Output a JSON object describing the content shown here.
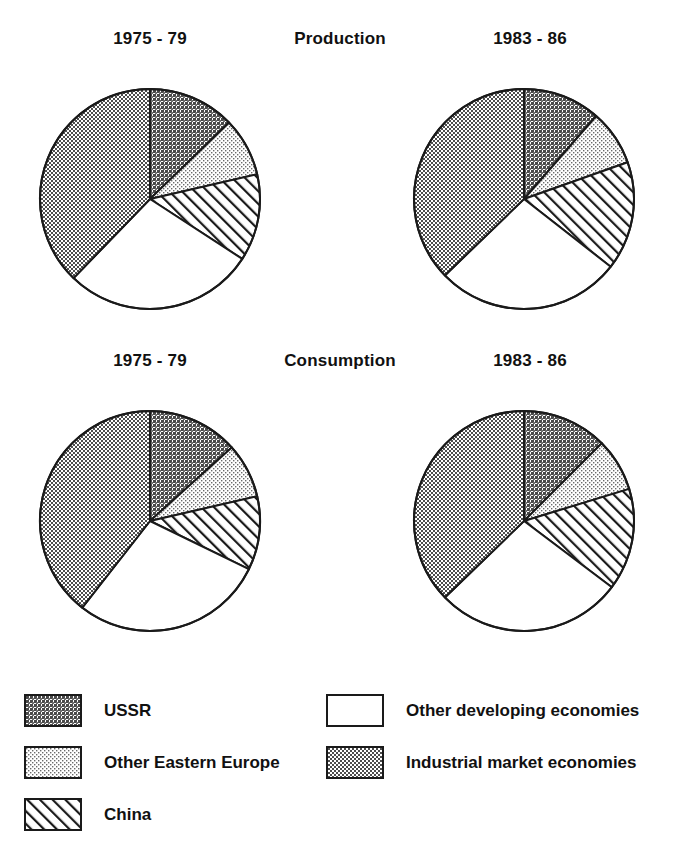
{
  "figure": {
    "caption": ""
  },
  "rows": [
    {
      "id": "production",
      "left_label": "1975 - 79",
      "center_label": "Production",
      "right_label": "1983 - 86"
    },
    {
      "id": "consumption",
      "left_label": "1975 - 79",
      "center_label": "Consumption",
      "right_label": "1983 - 86"
    }
  ],
  "legend": {
    "left_column": [
      {
        "key": "ussr",
        "label": "USSR",
        "pattern": "dark-checker",
        "color": "#8a8a8a"
      },
      {
        "key": "other_eastern_europe",
        "label": "Other Eastern Europe",
        "pattern": "light-dots",
        "color": "#d0d0d0"
      },
      {
        "key": "china",
        "label": "China",
        "pattern": "diagonal-hatch",
        "color": "#ffffff"
      }
    ],
    "right_column": [
      {
        "key": "other_developing",
        "label": "Other developing economies",
        "pattern": "solid-white",
        "color": "#ffffff"
      },
      {
        "key": "industrial_market",
        "label": "Industrial market economies",
        "pattern": "medium-checker",
        "color": "#bdbdbd"
      }
    ]
  },
  "chart_data": [
    {
      "type": "pie",
      "id": "production-1975-79",
      "title": "Production 1975 - 79",
      "period": "1975 - 79",
      "panel": "Production",
      "grid": false,
      "legend_position": "bottom",
      "start_angle_deg": 0,
      "direction": "clockwise",
      "categories": [
        "USSR",
        "Other Eastern Europe",
        "China",
        "Other developing economies",
        "Industrial market economies"
      ],
      "values": [
        12.8,
        8.6,
        12.8,
        28.1,
        37.7
      ],
      "angles_deg": [
        46,
        31,
        46,
        101,
        136
      ],
      "patterns": [
        "dark-checker",
        "light-dots",
        "diagonal-hatch",
        "solid-white",
        "medium-checker"
      ]
    },
    {
      "type": "pie",
      "id": "production-1983-86",
      "title": "Production 1983 - 86",
      "period": "1983 - 86",
      "panel": "Production",
      "grid": false,
      "legend_position": "bottom",
      "start_angle_deg": 0,
      "direction": "clockwise",
      "categories": [
        "USSR",
        "Other Eastern Europe",
        "China",
        "Other developing economies",
        "Industrial market economies"
      ],
      "values": [
        11.4,
        8.2,
        16.0,
        27.2,
        37.2
      ],
      "angles_deg": [
        41,
        29.5,
        57.5,
        98,
        134
      ],
      "patterns": [
        "dark-checker",
        "light-dots",
        "diagonal-hatch",
        "solid-white",
        "medium-checker"
      ]
    },
    {
      "type": "pie",
      "id": "consumption-1975-79",
      "title": "Consumption 1975 - 79",
      "period": "1975 - 79",
      "panel": "Consumption",
      "grid": false,
      "legend_position": "bottom",
      "start_angle_deg": 0,
      "direction": "clockwise",
      "categories": [
        "USSR",
        "Other Eastern Europe",
        "China",
        "Other developing economies",
        "Industrial market economies"
      ],
      "values": [
        13.3,
        8.1,
        10.8,
        28.3,
        39.5
      ],
      "angles_deg": [
        48,
        29,
        39,
        102,
        142
      ],
      "patterns": [
        "dark-checker",
        "light-dots",
        "diagonal-hatch",
        "solid-white",
        "medium-checker"
      ]
    },
    {
      "type": "pie",
      "id": "consumption-1983-86",
      "title": "Consumption 1983 - 86",
      "period": "1983 - 86",
      "panel": "Consumption",
      "grid": false,
      "legend_position": "bottom",
      "start_angle_deg": 0,
      "direction": "clockwise",
      "categories": [
        "USSR",
        "Other Eastern Europe",
        "China",
        "Other developing economies",
        "Industrial market economies"
      ],
      "values": [
        12.5,
        7.8,
        15.0,
        27.5,
        37.2
      ],
      "angles_deg": [
        45,
        28,
        54,
        99,
        134
      ],
      "patterns": [
        "dark-checker",
        "light-dots",
        "diagonal-hatch",
        "solid-white",
        "medium-checker"
      ]
    }
  ]
}
